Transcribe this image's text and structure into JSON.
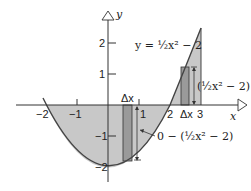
{
  "diagram": {
    "function_label": "y = ½x² − 2",
    "axis_labels": {
      "x": "x",
      "y": "y"
    },
    "x_ticks": [
      {
        "value": -2,
        "label": "−2"
      },
      {
        "value": -1,
        "label": "−1"
      },
      {
        "value": 1,
        "label": "1"
      },
      {
        "value": 2,
        "label": "2"
      },
      {
        "value": 3,
        "label": "3"
      }
    ],
    "y_ticks": [
      {
        "value": 2,
        "label": "2"
      },
      {
        "value": 1,
        "label": "1"
      },
      {
        "value": -1,
        "label": "−1"
      },
      {
        "value": -2,
        "label": "−2"
      }
    ],
    "annotations": {
      "left_strip_width": "Δx",
      "right_strip_width": "Δx",
      "right_height": "(½x² − 2)",
      "left_height": "0 − (½x² − 2)"
    },
    "colors": {
      "shade": "#c8c8c8",
      "strip": "#9a9a9a",
      "curve": "#444444",
      "axis": "#333333"
    }
  }
}
